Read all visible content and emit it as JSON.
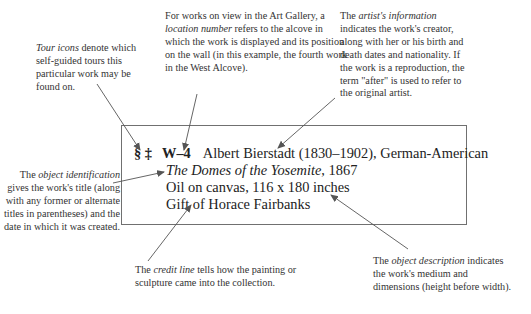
{
  "callouts": {
    "tour_icons": {
      "term": "Tour icons",
      "text": " denote which self-guided tours this particular work may be found on."
    },
    "location_number": {
      "prefix": "For works on view in the Art Gallery, a ",
      "term": "location number",
      "text": " refers to the alcove in which the work is displayed and its position on the wall (in this example, the fourth work in the West Alcove)."
    },
    "artist_information": {
      "prefix": "The ",
      "term": "artist's information",
      "text": " indicates the work's creator, along with her or his birth and death dates and nationality. If the work is a reproduction, the term \"after\" is used to refer to the original artist."
    },
    "object_identification": {
      "prefix": "The ",
      "term": "object identification",
      "text": " gives the work's title (along with any former or alternate titles in parentheses) and the date in which it was created."
    },
    "credit_line": {
      "prefix": "The ",
      "term": "credit line",
      "text": " tells how the painting or sculpture came into the collection."
    },
    "object_description": {
      "prefix": "The ",
      "term": "object description",
      "text": " indicates the work's medium and dimensions (height before width)."
    }
  },
  "label": {
    "tour_icons": "§ ‡",
    "location_number": "W–4",
    "artist": "Albert Bierstadt (1830–1902), German-American",
    "title": "The Domes of the Yosemite",
    "date": ", 1867",
    "medium": "Oil on canvas, 116 x 180 inches",
    "credit": "Gift of Horace Fairbanks"
  },
  "colors": {
    "text": "#2a2a2a",
    "box_border": "#707070",
    "arrow": "#555555"
  }
}
